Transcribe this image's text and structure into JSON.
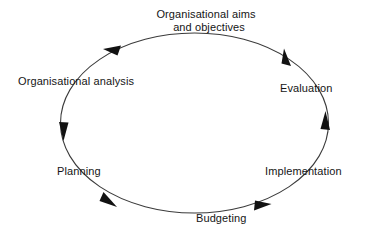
{
  "diagram": {
    "type": "cycle",
    "title": "",
    "direction": "counterclockwise",
    "shape": "ellipse",
    "line_color": "#3b3b3b",
    "text_color": "#151515",
    "background_color": "#ffffff",
    "ellipse": {
      "center_x": 194.5,
      "center_y": 123,
      "radius_x": 134,
      "radius_y": 90
    },
    "nodes": [
      {
        "id": "aims",
        "label_line_1": "Organisational aims",
        "label_line_2": "and objectives",
        "position": "top"
      },
      {
        "id": "analysis",
        "label": "Organisational analysis",
        "position": "upper-left"
      },
      {
        "id": "planning",
        "label": "Planning",
        "position": "lower-left"
      },
      {
        "id": "budgeting",
        "label": "Budgeting",
        "position": "bottom"
      },
      {
        "id": "implementation",
        "label": "Implementation",
        "position": "lower-right"
      },
      {
        "id": "evaluation",
        "label": "Evaluation",
        "position": "upper-right"
      }
    ],
    "arrows": [
      {
        "id": "arrow-top-left",
        "at_angle_deg": 145,
        "points_toward": "analysis"
      },
      {
        "id": "arrow-left",
        "at_angle_deg": 195,
        "points_toward": "planning"
      },
      {
        "id": "arrow-bottom-left",
        "at_angle_deg": 240,
        "points_toward": "budgeting"
      },
      {
        "id": "arrow-bottom-right",
        "at_angle_deg": 300,
        "points_toward": "implementation"
      },
      {
        "id": "arrow-right",
        "at_angle_deg": 352,
        "points_toward": "evaluation"
      },
      {
        "id": "arrow-top-right",
        "at_angle_deg": 38,
        "points_toward": "aims"
      }
    ]
  }
}
